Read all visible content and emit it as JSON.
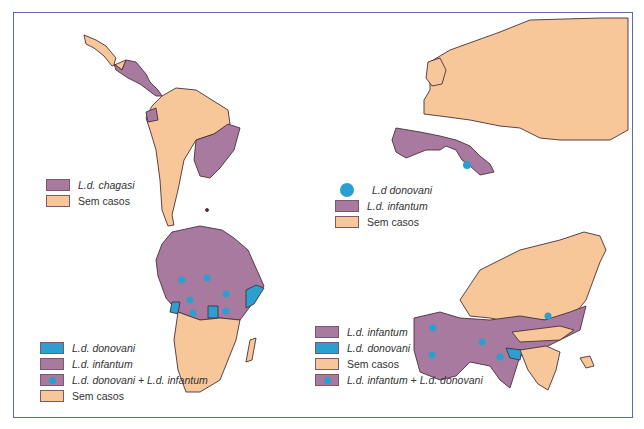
{
  "colors": {
    "chagasi": "#a87a9f",
    "infantum": "#a87a9f",
    "donovani": "#2a9fd0",
    "no_cases": "#f7c79a",
    "border": "#4a3038",
    "frame": "#5a6aa8"
  },
  "panels": {
    "americas": {
      "legend": [
        {
          "swatch": "chagasi",
          "label": "L.d. chagasi",
          "italic": true
        },
        {
          "swatch": "no_cases",
          "label": "Sem casos",
          "italic": false
        }
      ]
    },
    "europe": {
      "legend": [
        {
          "swatch": "donovani-dot",
          "label": "L.d donovani",
          "italic": true
        },
        {
          "swatch": "infantum",
          "label": "L.d. infantum",
          "italic": true
        },
        {
          "swatch": "no_cases",
          "label": "Sem casos",
          "italic": false
        }
      ]
    },
    "africa": {
      "legend": [
        {
          "swatch": "donovani",
          "label": "L.d. donovani",
          "italic": true
        },
        {
          "swatch": "infantum",
          "label": "L.d. infantum",
          "italic": true
        },
        {
          "swatch": "both",
          "label": "L.d. donovani + L.d. infantum",
          "italic": true
        },
        {
          "swatch": "no_cases",
          "label": "Sem casos",
          "italic": false
        }
      ]
    },
    "asia": {
      "legend": [
        {
          "swatch": "infantum",
          "label": "L.d. infantum",
          "italic": true
        },
        {
          "swatch": "donovani",
          "label": "L.d. donovani",
          "italic": true
        },
        {
          "swatch": "no_cases",
          "label": "Sem casos",
          "italic": false
        },
        {
          "swatch": "both",
          "label": "L.d. infantum + L.d. donovani",
          "italic": true
        }
      ]
    }
  }
}
